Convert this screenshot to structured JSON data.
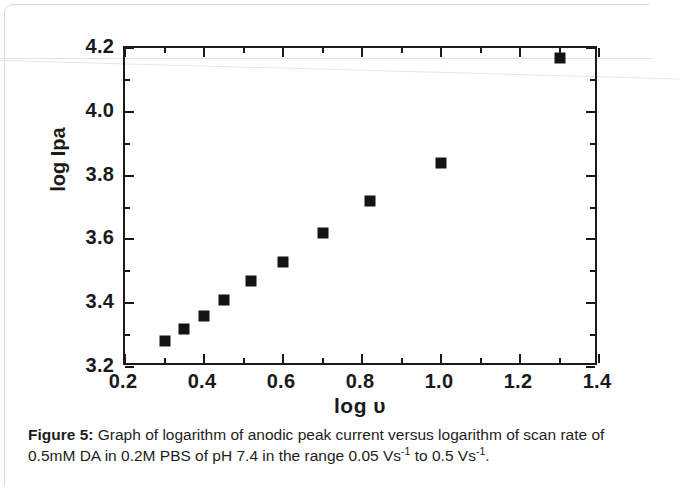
{
  "figure": {
    "axis": {
      "y_title": "log Ipa",
      "x_title": "log υ",
      "y_ticks": [
        "3.2",
        "3.4",
        "3.6",
        "3.8",
        "4.0",
        "4.2"
      ],
      "x_ticks": [
        "0.2",
        "0.4",
        "0.6",
        "0.8",
        "1.0",
        "1.2",
        "1.4"
      ]
    }
  },
  "caption": {
    "label": "Figure 5:",
    "text_before_sup1": " Graph of logarithm of anodic peak current versus logarithm of scan rate of 0.5mM DA in 0.2M PBS of pH 7.4 in the range 0.05 Vs",
    "sup1": "-1",
    "text_between": " to 0.5 Vs",
    "sup2": "-1",
    "text_after": "."
  },
  "chart_data": {
    "type": "scatter",
    "title": "",
    "xlabel": "log υ",
    "ylabel": "log Ipa",
    "xlim": [
      0.2,
      1.4
    ],
    "ylim": [
      3.2,
      4.2
    ],
    "x_major_step": 0.2,
    "x_minor_step": 0.1,
    "y_major_step": 0.2,
    "y_minor_step": 0.1,
    "grid": false,
    "legend": null,
    "marker": "filled-square",
    "marker_color": "#141414",
    "series": [
      {
        "name": "log Ipa vs log υ",
        "points": [
          {
            "x": 0.3,
            "y": 3.28
          },
          {
            "x": 0.35,
            "y": 3.32
          },
          {
            "x": 0.4,
            "y": 3.36
          },
          {
            "x": 0.45,
            "y": 3.41
          },
          {
            "x": 0.52,
            "y": 3.47
          },
          {
            "x": 0.6,
            "y": 3.53
          },
          {
            "x": 0.7,
            "y": 3.62
          },
          {
            "x": 0.82,
            "y": 3.72
          },
          {
            "x": 1.0,
            "y": 3.84
          },
          {
            "x": 1.3,
            "y": 4.17
          }
        ]
      }
    ]
  }
}
